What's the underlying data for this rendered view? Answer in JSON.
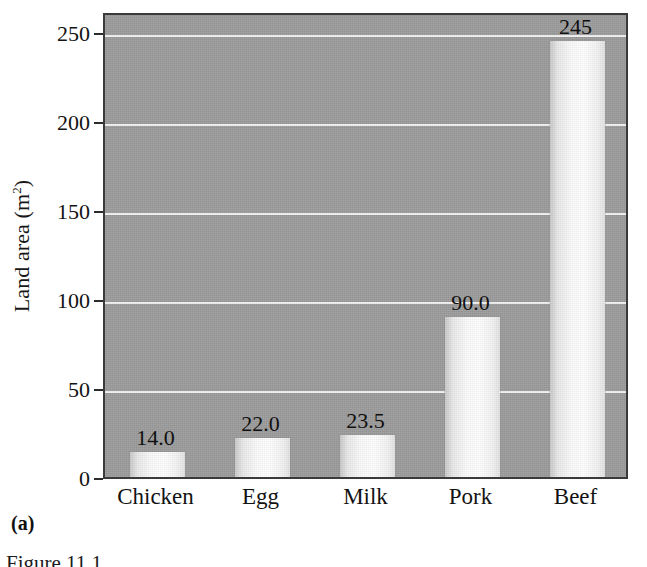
{
  "chart_data": {
    "type": "bar",
    "title": "",
    "xlabel": "",
    "ylabel": "Land area (m2)",
    "ylabel_base": "Land area (m",
    "ylabel_sup": "2",
    "ylabel_close": ")",
    "categories": [
      "Chicken",
      "Egg",
      "Milk",
      "Pork",
      "Beef"
    ],
    "values": [
      14.0,
      22.0,
      23.5,
      90.0,
      245
    ],
    "data_labels": [
      "14.0",
      "22.0",
      "23.5",
      "90.0",
      "245"
    ],
    "ylim": [
      0,
      262
    ],
    "yticks": [
      0,
      50,
      100,
      150,
      200,
      250
    ],
    "ytick_labels": [
      "0",
      "50",
      "100",
      "150",
      "200",
      "250"
    ],
    "gridlines": [
      50,
      100,
      150,
      200,
      250
    ],
    "grid": true,
    "legend": null,
    "legend_position": "none",
    "panel_background_color": "#9c9c9c",
    "gridline_color": "#f2f2f2",
    "bar_color": "#fbfbfb",
    "axis_color": "#3a3a3a"
  },
  "annotations": {
    "panel_letter": "(a)",
    "figure_caption": "Figure 11.1"
  }
}
